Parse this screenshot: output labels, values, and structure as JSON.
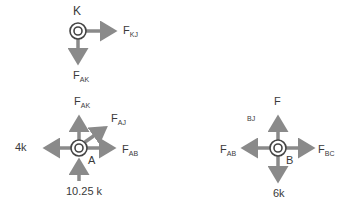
{
  "diagram": {
    "colors": {
      "arrow": "#8a8a8a",
      "joint_ring": "#444444",
      "text": "#3a3a3a"
    },
    "joints": {
      "K": {
        "name": "K",
        "forces": [
          {
            "id": "F_KJ",
            "main": "F",
            "sub": "KJ",
            "direction": "right"
          },
          {
            "id": "F_AK",
            "main": "F",
            "sub": "AK",
            "direction": "down"
          }
        ]
      },
      "A": {
        "name": "A",
        "forces": [
          {
            "id": "F_AK",
            "main": "F",
            "sub": "AK",
            "direction": "up"
          },
          {
            "id": "F_AJ",
            "main": "F",
            "sub": "AJ",
            "direction": "up-right"
          },
          {
            "id": "F_AB",
            "main": "F",
            "sub": "AB",
            "direction": "right"
          },
          {
            "id": "load_4k",
            "label": "4k",
            "direction": "left"
          },
          {
            "id": "reaction",
            "label": "10.25 k",
            "direction": "up (from below)"
          }
        ]
      },
      "B": {
        "name": "B",
        "forces": [
          {
            "id": "F_BJ",
            "main": "F",
            "sub": "BJ",
            "direction": "up"
          },
          {
            "id": "F_AB",
            "main": "F",
            "sub": "AB",
            "direction": "left"
          },
          {
            "id": "F_BC",
            "main": "F",
            "sub": "BC",
            "direction": "right"
          },
          {
            "id": "load_6k",
            "label": "6k",
            "direction": "down"
          }
        ]
      }
    }
  }
}
